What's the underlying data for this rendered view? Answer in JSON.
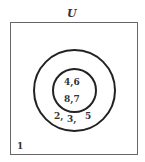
{
  "universe_label": "U",
  "outer_set": {
    "only_elements": [
      "2,",
      "3,",
      "5"
    ]
  },
  "inner_set": {
    "elements_line1": "4,6",
    "elements_line2": "8,7"
  },
  "outside_elements": "1"
}
